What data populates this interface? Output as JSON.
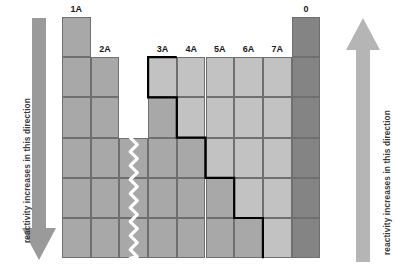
{
  "figure": {
    "type": "periodic-table-reactivity-diagram"
  },
  "left_arrow": {
    "label": "reactivity increases in this direction",
    "direction": "down",
    "color": "#9a9a9a"
  },
  "right_arrow": {
    "label": "reactivity increases in this direction",
    "direction": "up",
    "color": "#b5b5b5"
  },
  "colors": {
    "metal": "#a8a8a8",
    "metalloid": "#b9b9b9",
    "nonmetal": "#c2c2c2",
    "noble": "#848484",
    "grid_line": "#6f6f6f",
    "stair_line": "#000000",
    "break_line": "#ffffff",
    "header_text": "#1a1a1a",
    "label_text": "#3a3a3a",
    "background": "#ffffff"
  },
  "columns": [
    {
      "id": "c1",
      "label": "1A",
      "label_row": 0,
      "x": 0
    },
    {
      "id": "c2",
      "label": "2A",
      "label_row": 1,
      "x": 1
    },
    {
      "id": "cgap",
      "label": "",
      "label_row": -1,
      "x": 2
    },
    {
      "id": "c3",
      "label": "3A",
      "label_row": 1,
      "x": 3
    },
    {
      "id": "c4",
      "label": "4A",
      "label_row": 1,
      "x": 4
    },
    {
      "id": "c5",
      "label": "5A",
      "label_row": 1,
      "x": 5
    },
    {
      "id": "c6",
      "label": "6A",
      "label_row": 1,
      "x": 6
    },
    {
      "id": "c7",
      "label": "7A",
      "label_row": 1,
      "x": 7
    },
    {
      "id": "c0",
      "label": "0",
      "label_row": 0,
      "x": 8
    }
  ],
  "rows": 6,
  "cells": [
    {
      "col": 0,
      "row": 0,
      "kind": "metal"
    },
    {
      "col": 0,
      "row": 1,
      "kind": "metal"
    },
    {
      "col": 0,
      "row": 2,
      "kind": "metal"
    },
    {
      "col": 0,
      "row": 3,
      "kind": "metal"
    },
    {
      "col": 0,
      "row": 4,
      "kind": "metal"
    },
    {
      "col": 0,
      "row": 5,
      "kind": "metal"
    },
    {
      "col": 1,
      "row": 1,
      "kind": "metal"
    },
    {
      "col": 1,
      "row": 2,
      "kind": "metal"
    },
    {
      "col": 1,
      "row": 3,
      "kind": "metal"
    },
    {
      "col": 1,
      "row": 4,
      "kind": "metal"
    },
    {
      "col": 1,
      "row": 5,
      "kind": "metal"
    },
    {
      "col": 2,
      "row": 3,
      "kind": "metal"
    },
    {
      "col": 2,
      "row": 4,
      "kind": "metal"
    },
    {
      "col": 2,
      "row": 5,
      "kind": "metal"
    },
    {
      "col": 3,
      "row": 1,
      "kind": "nonmetal"
    },
    {
      "col": 3,
      "row": 2,
      "kind": "metal"
    },
    {
      "col": 3,
      "row": 3,
      "kind": "metal"
    },
    {
      "col": 3,
      "row": 4,
      "kind": "metal"
    },
    {
      "col": 3,
      "row": 5,
      "kind": "metal"
    },
    {
      "col": 4,
      "row": 1,
      "kind": "nonmetal"
    },
    {
      "col": 4,
      "row": 2,
      "kind": "nonmetal"
    },
    {
      "col": 4,
      "row": 3,
      "kind": "metal"
    },
    {
      "col": 4,
      "row": 4,
      "kind": "metal"
    },
    {
      "col": 4,
      "row": 5,
      "kind": "metal"
    },
    {
      "col": 5,
      "row": 1,
      "kind": "nonmetal"
    },
    {
      "col": 5,
      "row": 2,
      "kind": "nonmetal"
    },
    {
      "col": 5,
      "row": 3,
      "kind": "nonmetal"
    },
    {
      "col": 5,
      "row": 4,
      "kind": "metal"
    },
    {
      "col": 5,
      "row": 5,
      "kind": "metal"
    },
    {
      "col": 6,
      "row": 1,
      "kind": "nonmetal"
    },
    {
      "col": 6,
      "row": 2,
      "kind": "nonmetal"
    },
    {
      "col": 6,
      "row": 3,
      "kind": "nonmetal"
    },
    {
      "col": 6,
      "row": 4,
      "kind": "nonmetal"
    },
    {
      "col": 6,
      "row": 5,
      "kind": "metal"
    },
    {
      "col": 7,
      "row": 1,
      "kind": "nonmetal"
    },
    {
      "col": 7,
      "row": 2,
      "kind": "nonmetal"
    },
    {
      "col": 7,
      "row": 3,
      "kind": "nonmetal"
    },
    {
      "col": 7,
      "row": 4,
      "kind": "nonmetal"
    },
    {
      "col": 7,
      "row": 5,
      "kind": "nonmetal"
    },
    {
      "col": 8,
      "row": 0,
      "kind": "noble"
    },
    {
      "col": 8,
      "row": 1,
      "kind": "noble"
    },
    {
      "col": 8,
      "row": 2,
      "kind": "noble"
    },
    {
      "col": 8,
      "row": 3,
      "kind": "noble"
    },
    {
      "col": 8,
      "row": 4,
      "kind": "noble"
    },
    {
      "col": 8,
      "row": 5,
      "kind": "noble"
    }
  ],
  "stair_steps": [
    {
      "col": 3,
      "row": 1
    },
    {
      "col": 3,
      "row": 2,
      "down": true
    },
    {
      "col": 4,
      "row": 3
    },
    {
      "col": 5,
      "row": 4
    },
    {
      "col": 6,
      "row": 5
    }
  ],
  "break_line": {
    "col": 2,
    "from_row": 3,
    "to_row": 5,
    "style": "zigzag"
  }
}
